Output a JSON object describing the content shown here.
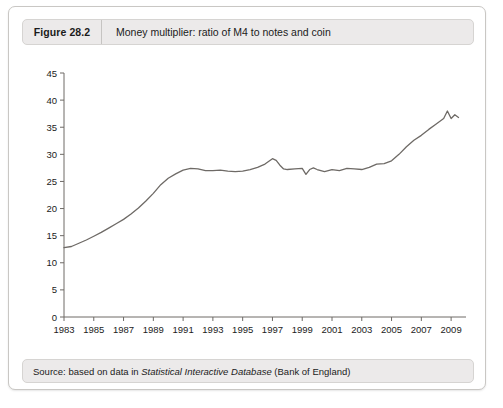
{
  "figure": {
    "label": "Figure 28.2",
    "title": "Money multiplier: ratio of M4 to notes and coin",
    "source_prefix": "Source: based on data in ",
    "source_italic": "Statistical Interactive Database",
    "source_suffix": " (Bank of England)"
  },
  "colors": {
    "header_bg": "#eceaea",
    "border": "#c9c7c4",
    "line": "#6e6a66",
    "axis": "#6e6a66",
    "text": "#1b1b1b"
  },
  "chart_data": {
    "type": "line",
    "title": "Money multiplier: ratio of M4 to notes and coin",
    "xlabel": "",
    "ylabel": "",
    "xlim": [
      1983,
      2010
    ],
    "ylim": [
      0,
      45
    ],
    "grid": false,
    "legend": null,
    "yticks": [
      0,
      5,
      10,
      15,
      20,
      25,
      30,
      35,
      40,
      45
    ],
    "xticks": [
      1983,
      1985,
      1987,
      1989,
      1991,
      1993,
      1995,
      1997,
      1999,
      2001,
      2003,
      2005,
      2007,
      2009
    ],
    "series": [
      {
        "name": "Money multiplier (M4 / notes and coin)",
        "x": [
          1983.0,
          1983.5,
          1984.0,
          1984.5,
          1985.0,
          1985.5,
          1986.0,
          1986.5,
          1987.0,
          1987.5,
          1988.0,
          1988.5,
          1989.0,
          1989.5,
          1990.0,
          1990.5,
          1991.0,
          1991.5,
          1992.0,
          1992.5,
          1993.0,
          1993.5,
          1994.0,
          1994.5,
          1995.0,
          1995.5,
          1996.0,
          1996.5,
          1997.0,
          1997.25,
          1997.5,
          1997.75,
          1998.0,
          1998.5,
          1999.0,
          1999.25,
          1999.5,
          1999.75,
          2000.0,
          2000.5,
          2001.0,
          2001.5,
          2002.0,
          2002.5,
          2003.0,
          2003.5,
          2004.0,
          2004.5,
          2005.0,
          2005.5,
          2006.0,
          2006.5,
          2007.0,
          2007.5,
          2008.0,
          2008.5,
          2008.75,
          2009.0,
          2009.25,
          2009.5
        ],
        "y": [
          12.8,
          13.0,
          13.6,
          14.2,
          14.9,
          15.6,
          16.4,
          17.2,
          18.0,
          19.0,
          20.1,
          21.4,
          22.8,
          24.4,
          25.6,
          26.4,
          27.1,
          27.4,
          27.3,
          27.0,
          27.0,
          27.1,
          26.9,
          26.8,
          26.9,
          27.2,
          27.6,
          28.2,
          29.2,
          28.9,
          28.0,
          27.3,
          27.2,
          27.3,
          27.4,
          26.3,
          27.2,
          27.5,
          27.2,
          26.8,
          27.2,
          27.0,
          27.4,
          27.3,
          27.2,
          27.6,
          28.2,
          28.3,
          28.8,
          30.0,
          31.4,
          32.6,
          33.5,
          34.6,
          35.6,
          36.6,
          38.0,
          36.6,
          37.3,
          36.8
        ]
      }
    ]
  }
}
